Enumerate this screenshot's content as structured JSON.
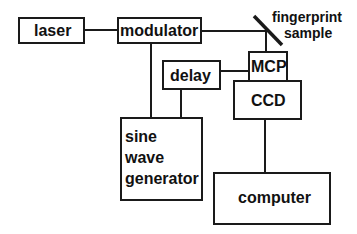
{
  "diagram": {
    "nodes": {
      "laser": "laser",
      "modulator": "modulator",
      "delay": "delay",
      "mcp": "MCP",
      "ccd": "CCD",
      "sine_wave_generator": [
        "sine",
        "wave",
        "generator"
      ],
      "computer": "computer",
      "fingerprint_sample": [
        "fingerprint",
        "sample"
      ]
    },
    "edges": [
      [
        "laser",
        "modulator"
      ],
      [
        "modulator",
        "fingerprint_sample"
      ],
      [
        "fingerprint_sample",
        "mcp"
      ],
      [
        "modulator",
        "sine_wave_generator"
      ],
      [
        "delay",
        "sine_wave_generator"
      ],
      [
        "delay",
        "mcp"
      ],
      [
        "ccd",
        "computer"
      ]
    ],
    "colors": {
      "stroke": "#1a1a1a",
      "background": "#ffffff"
    }
  }
}
